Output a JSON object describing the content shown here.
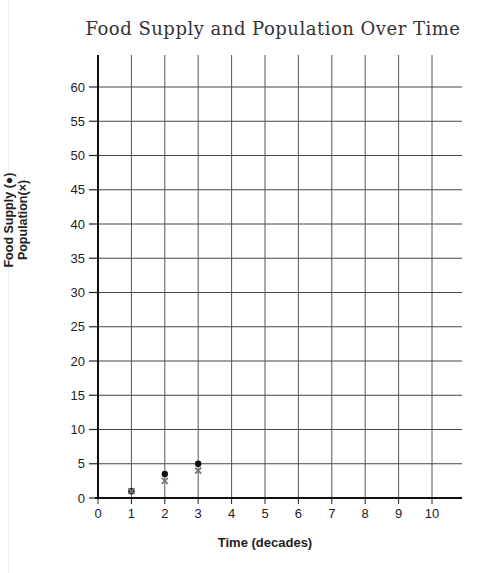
{
  "chart_data": {
    "type": "scatter",
    "title": "Food Supply and Population Over Time",
    "xlabel": "Time (decades)",
    "ylabel": "Food Supply (●) Population(×)",
    "ylabel_lines": [
      "Food Supply (●)",
      "Population(×)"
    ],
    "x_ticks": [
      0,
      1,
      2,
      3,
      4,
      5,
      6,
      7,
      8,
      9,
      10
    ],
    "y_ticks": [
      0,
      5,
      10,
      15,
      20,
      25,
      30,
      35,
      40,
      45,
      50,
      55,
      60
    ],
    "xlim": [
      0,
      11
    ],
    "ylim": [
      0,
      64
    ],
    "grid": true,
    "legend": "embedded in y-axis label",
    "series": [
      {
        "name": "Food Supply",
        "marker": "filled-circle",
        "color": "#111111",
        "points": [
          {
            "x": 1,
            "y": 1
          },
          {
            "x": 2,
            "y": 3.5
          },
          {
            "x": 3,
            "y": 5
          }
        ]
      },
      {
        "name": "Population",
        "marker": "x",
        "color": "#777777",
        "points": [
          {
            "x": 1,
            "y": 1
          },
          {
            "x": 2,
            "y": 2.5
          },
          {
            "x": 3,
            "y": 4
          }
        ]
      }
    ]
  }
}
